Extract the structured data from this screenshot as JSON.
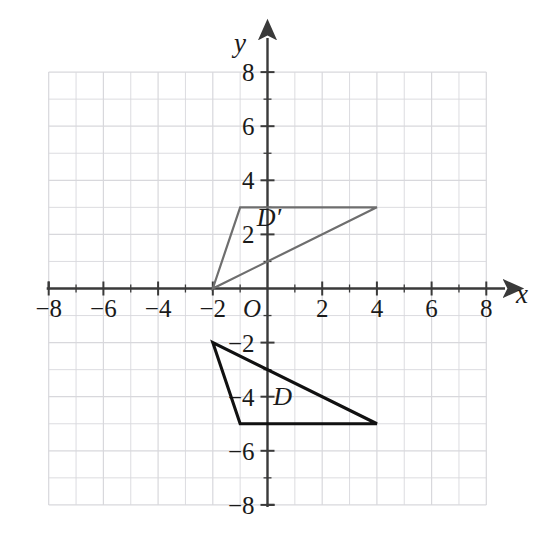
{
  "figure": {
    "title": "",
    "background_color": "#ffffff",
    "width": 543,
    "height": 536
  },
  "chart_data": {
    "type": "scatter",
    "title": "",
    "xlabel": "x",
    "ylabel": "y",
    "xlim": [
      -8,
      8
    ],
    "ylim": [
      -8,
      8
    ],
    "grid": true,
    "grid_step": 1,
    "grid_color": "#d8d8dc",
    "axis_color": "#3a3a3a",
    "legend": "none",
    "x_ticks": [
      -8,
      -6,
      -4,
      -2,
      2,
      4,
      6,
      8
    ],
    "y_ticks": [
      -8,
      -6,
      -4,
      -2,
      2,
      4,
      6,
      8
    ],
    "x_tick_labels": [
      "−8",
      "−6",
      "−4",
      "−2",
      "2",
      "4",
      "6",
      "8"
    ],
    "y_tick_labels": [
      "−8",
      "−6",
      "−4",
      "−2",
      "2",
      "4",
      "6",
      "8"
    ],
    "origin_label": "O",
    "minor_ticks": [
      -7,
      -5,
      -3,
      -1,
      1,
      3,
      5,
      7
    ],
    "series": [
      {
        "name": "D",
        "label": "D",
        "label_position": [
          0.55,
          -4.3
        ],
        "type": "polygon",
        "closed": true,
        "color": "#111111",
        "line_width": 3.1,
        "fill": "none",
        "points": [
          [
            -2,
            -2
          ],
          [
            -1,
            -5
          ],
          [
            4,
            -5
          ]
        ],
        "vertices_text": "(-2, -2), (-1, -5), (4, -5)"
      },
      {
        "name": "D-prime",
        "label": "D′",
        "label_position": [
          0.05,
          2.3
        ],
        "type": "polygon",
        "closed": true,
        "color": "#6e6e6e",
        "line_width": 2.2,
        "fill": "none",
        "points": [
          [
            -2,
            0
          ],
          [
            -1,
            3
          ],
          [
            4,
            3
          ]
        ],
        "vertices_text": "(-2, 0), (-1, 3), (4, 3)"
      }
    ]
  }
}
